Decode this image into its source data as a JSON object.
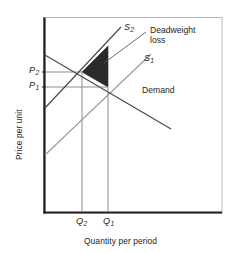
{
  "figure": {
    "axes": {
      "x_title": "Quantity per period",
      "y_title": "Price per unit"
    },
    "price_ticks": [
      {
        "label": "P",
        "sub": "2",
        "y": 72
      },
      {
        "label": "P",
        "sub": "1",
        "y": 87
      }
    ],
    "quantity_ticks": [
      {
        "label": "Q",
        "sub": "2",
        "x": 82
      },
      {
        "label": "Q",
        "sub": "1",
        "x": 108
      }
    ],
    "curves": [
      {
        "name": "supply-shifted",
        "label": "S",
        "sub": "2"
      },
      {
        "name": "supply-original",
        "label": "S",
        "sub": "1"
      },
      {
        "name": "demand",
        "label": "Demand",
        "sub": ""
      }
    ],
    "callout": {
      "line1": "Deadweight",
      "line2": "loss"
    },
    "colors": {
      "frame": "#231f20",
      "curve_dark": "#3a3a3a",
      "curve_light": "#9a9a9a",
      "shade_fill": "#2b2b2b",
      "guide": "#8d8d8d",
      "leader": "#5a5a5a",
      "background": "#ffffff"
    }
  }
}
